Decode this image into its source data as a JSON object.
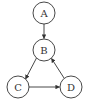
{
  "diagram": {
    "type": "directed-graph",
    "nodes": [
      {
        "id": "A",
        "label": "A",
        "cx": 44,
        "cy": 13
      },
      {
        "id": "B",
        "label": "B",
        "cx": 44,
        "cy": 50
      },
      {
        "id": "C",
        "label": "C",
        "cx": 18,
        "cy": 87
      },
      {
        "id": "D",
        "label": "D",
        "cx": 71,
        "cy": 87
      }
    ],
    "edges": [
      {
        "from": "A",
        "to": "B"
      },
      {
        "from": "B",
        "to": "C"
      },
      {
        "from": "C",
        "to": "D"
      },
      {
        "from": "D",
        "to": "B"
      }
    ],
    "colors": {
      "stroke": "#333333",
      "background": "#ffffff"
    }
  }
}
